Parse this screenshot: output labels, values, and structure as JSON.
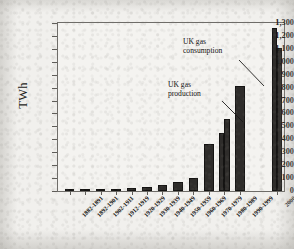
{
  "chart_data": {
    "type": "bar",
    "title": "",
    "xlabel": "",
    "ylabel": "TWh",
    "ylim": [
      0,
      1300
    ],
    "ytick_step": 100,
    "grid": false,
    "legend_position": "none",
    "categories": [
      "1882-1891",
      "1892-1901",
      "1902-1911",
      "1912-1919",
      "1920-1929",
      "1930-1939",
      "1940-1949",
      "1950-1959",
      "1960-1969",
      "1970-1979",
      "1980-1989",
      "1990-1999",
      "2000"
    ],
    "ytick_labels": [
      "0",
      "100",
      "200",
      "300",
      "400",
      "500",
      "600",
      "700",
      "800",
      "900",
      "1,000",
      "1,100",
      "1,200",
      "1,300"
    ],
    "series": [
      {
        "name": "UK gas production",
        "values": [
          4,
          7,
          10,
          13,
          27,
          34,
          47,
          66,
          102,
          365,
          450,
          815,
          1260
        ]
      },
      {
        "name": "UK gas consumption",
        "values": [
          null,
          null,
          null,
          null,
          null,
          null,
          null,
          null,
          null,
          null,
          555,
          null,
          1110
        ]
      }
    ],
    "annotations": [
      {
        "id": "consumption",
        "text_line1": "UK gas",
        "text_line2": "consumption",
        "points_to": "2000 consumption bar"
      },
      {
        "id": "production",
        "text_line1": "UK gas",
        "text_line2": "production",
        "points_to": "1980-1989 production bar"
      }
    ],
    "bar_color": "#2e2c2a"
  }
}
